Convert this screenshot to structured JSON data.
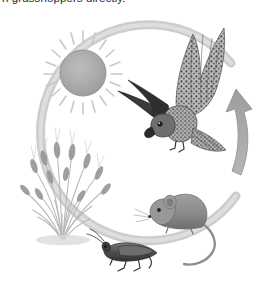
{
  "caption": {
    "text": "n grasshoppers directly.",
    "note": "partially clipped line of body text at top edge"
  },
  "diagram": {
    "title": "Food chain energy flow cycle",
    "type": "cycle",
    "cycle_direction": "clockwise",
    "arc_color": "#c9c9c9",
    "arrow_color": "#a8a8a8",
    "background": "#ffffff",
    "nodes": [
      {
        "id": "sun",
        "label": "Sun",
        "icon": "sun-icon",
        "x": 83,
        "y": 72,
        "color": "#9e9e9e"
      },
      {
        "id": "grass",
        "label": "Grass",
        "icon": "wheat-grass-icon",
        "x": 62,
        "y": 190,
        "color": "#8a8a8a"
      },
      {
        "id": "grasshopper",
        "label": "Grasshopper",
        "icon": "grasshopper-icon",
        "x": 124,
        "y": 252,
        "color": "#555555"
      },
      {
        "id": "mouse",
        "label": "Mouse",
        "icon": "mouse-icon",
        "x": 186,
        "y": 214,
        "color": "#8d8d8d"
      },
      {
        "id": "hawk",
        "label": "Hawk",
        "icon": "hawk-icon",
        "x": 196,
        "y": 78,
        "color": "#6b6b6b"
      }
    ],
    "flow_arrow": {
      "label": "energy flow",
      "direction": "upward",
      "position": "right"
    }
  }
}
